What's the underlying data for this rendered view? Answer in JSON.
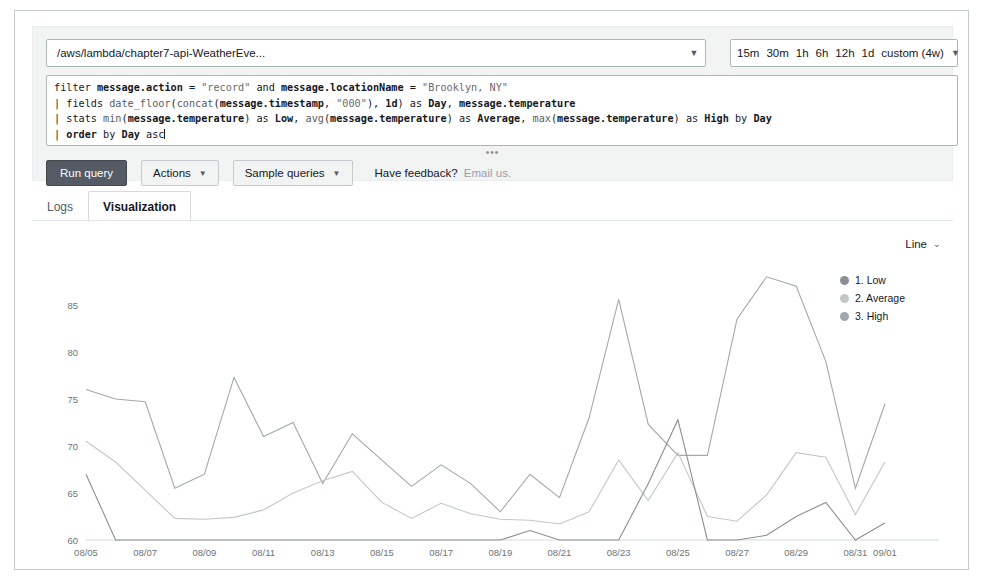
{
  "query_panel": {
    "log_group": "/aws/lambda/chapter7-api-WeatherEve...",
    "log_group_caret": "chevron-down-icon",
    "time_range": {
      "options": [
        "15m",
        "30m",
        "1h",
        "6h",
        "12h",
        "1d",
        "custom (4w)"
      ],
      "caret": "chevron-down-icon"
    },
    "query_lines": [
      [
        {
          "t": "filter ",
          "s": "kw"
        },
        {
          "t": "message.action",
          "s": "bold"
        },
        {
          "t": " = ",
          "s": "kw"
        },
        {
          "t": "\"record\"",
          "s": "str"
        },
        {
          "t": " and ",
          "s": "kw"
        },
        {
          "t": "message.locationName",
          "s": "bold"
        },
        {
          "t": " = ",
          "s": "kw"
        },
        {
          "t": "\"Brooklyn, NY\"",
          "s": "str"
        }
      ],
      [
        {
          "t": "| fields ",
          "s": "kw"
        },
        {
          "t": "date_floor",
          "s": "fn"
        },
        {
          "t": "(",
          "s": "kw"
        },
        {
          "t": "concat",
          "s": "fn"
        },
        {
          "t": "(",
          "s": "kw"
        },
        {
          "t": "message.timestamp",
          "s": "bold"
        },
        {
          "t": ", ",
          "s": "kw"
        },
        {
          "t": "\"000\"",
          "s": "str"
        },
        {
          "t": "), ",
          "s": "kw"
        },
        {
          "t": "1d",
          "s": "bold"
        },
        {
          "t": ") as ",
          "s": "kw"
        },
        {
          "t": "Day",
          "s": "bold"
        },
        {
          "t": ", ",
          "s": "kw"
        },
        {
          "t": "message.temperature",
          "s": "bold"
        }
      ],
      [
        {
          "t": "| stats ",
          "s": "kw"
        },
        {
          "t": "min",
          "s": "fn"
        },
        {
          "t": "(",
          "s": "kw"
        },
        {
          "t": "message.temperature",
          "s": "bold"
        },
        {
          "t": ") as ",
          "s": "kw"
        },
        {
          "t": "Low",
          "s": "bold"
        },
        {
          "t": ", ",
          "s": "kw"
        },
        {
          "t": "avg",
          "s": "fn"
        },
        {
          "t": "(",
          "s": "kw"
        },
        {
          "t": "message.temperature",
          "s": "bold"
        },
        {
          "t": ") as ",
          "s": "kw"
        },
        {
          "t": "Average",
          "s": "bold"
        },
        {
          "t": ", ",
          "s": "kw"
        },
        {
          "t": "max",
          "s": "fn"
        },
        {
          "t": "(",
          "s": "kw"
        },
        {
          "t": "message.temperature",
          "s": "bold"
        },
        {
          "t": ") as ",
          "s": "kw"
        },
        {
          "t": "High",
          "s": "bold"
        },
        {
          "t": " by ",
          "s": "kw"
        },
        {
          "t": "Day",
          "s": "bold"
        }
      ],
      [
        {
          "t": "| ",
          "s": "kw"
        },
        {
          "t": "order",
          "s": "bold"
        },
        {
          "t": " by ",
          "s": "kw"
        },
        {
          "t": "Day",
          "s": "bold"
        },
        {
          "t": " asc",
          "s": "kw"
        }
      ]
    ],
    "resize_handle": "•••",
    "run_button": "Run query",
    "actions_button": "Actions",
    "sample_queries_button": "Sample queries",
    "feedback_text": "Have feedback?",
    "feedback_link": "Email us."
  },
  "tabs": [
    {
      "label": "Logs",
      "active": false
    },
    {
      "label": "Visualization",
      "active": true
    }
  ],
  "legend": {
    "chart_type": "Line",
    "caret": "chevron-down-icon",
    "items": [
      {
        "label": "1. Low",
        "color": "#8a8f94"
      },
      {
        "label": "2. Average",
        "color": "#c3c7ca"
      },
      {
        "label": "3. High",
        "color": "#a3a8ac"
      }
    ]
  },
  "chart_data": {
    "type": "line",
    "title": "",
    "xlabel": "",
    "ylabel": "",
    "ylim": [
      60,
      88
    ],
    "yticks": [
      60,
      65,
      70,
      75,
      80,
      85
    ],
    "grid": false,
    "legend_position": "right",
    "x": [
      "08/05",
      "08/06",
      "08/07",
      "08/08",
      "08/09",
      "08/10",
      "08/11",
      "08/12",
      "08/13",
      "08/14",
      "08/15",
      "08/16",
      "08/17",
      "08/18",
      "08/19",
      "08/20",
      "08/21",
      "08/22",
      "08/23",
      "08/24",
      "08/25",
      "08/26",
      "08/27",
      "08/28",
      "08/29",
      "08/30",
      "08/31",
      "09/01"
    ],
    "xticks": [
      "08/05",
      "08/07",
      "08/09",
      "08/11",
      "08/13",
      "08/15",
      "08/17",
      "08/19",
      "08/21",
      "08/23",
      "08/25",
      "08/27",
      "08/29",
      "08/31",
      "09/01"
    ],
    "series": [
      {
        "name": "1. Low",
        "color": "#8a8f94",
        "values": [
          67.0,
          60.0,
          60.0,
          60.0,
          60.0,
          60.0,
          60.0,
          60.0,
          60.0,
          60.0,
          60.0,
          60.0,
          60.0,
          60.0,
          60.0,
          61.0,
          60.0,
          60.0,
          60.0,
          66.0,
          72.8,
          60.0,
          60.0,
          60.5,
          62.5,
          64.0,
          60.0,
          61.8
        ]
      },
      {
        "name": "2. Average",
        "color": "#c3c7ca",
        "values": [
          70.5,
          68.3,
          65.3,
          62.3,
          62.2,
          62.4,
          63.2,
          65.0,
          66.3,
          67.3,
          64.0,
          62.3,
          63.9,
          62.8,
          62.2,
          62.1,
          61.7,
          63.0,
          68.5,
          64.2,
          69.3,
          62.5,
          62.0,
          64.8,
          69.3,
          68.8,
          62.7,
          68.3
        ]
      },
      {
        "name": "3. High",
        "color": "#a3a8ac",
        "values": [
          76.0,
          75.0,
          74.7,
          65.5,
          67.0,
          77.3,
          71.0,
          72.5,
          66.0,
          71.3,
          68.5,
          65.7,
          68.0,
          66.0,
          63.0,
          67.0,
          64.5,
          73.0,
          85.6,
          72.3,
          69.0,
          69.0,
          83.5,
          88.6,
          87.0,
          79.0,
          65.5,
          74.5
        ]
      }
    ]
  }
}
